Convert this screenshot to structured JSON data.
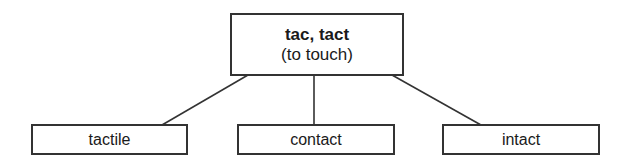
{
  "diagram": {
    "root": {
      "title": "tac, tact",
      "subtitle": "(to touch)"
    },
    "children": [
      {
        "label": "tactile"
      },
      {
        "label": "contact"
      },
      {
        "label": "intact"
      }
    ],
    "colors": {
      "line": "#333333",
      "text": "#1a1a1a",
      "background": "#ffffff"
    }
  }
}
